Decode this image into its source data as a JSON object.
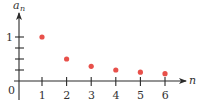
{
  "chart_data": {
    "type": "scatter",
    "title": "",
    "xlabel": "n",
    "ylabel": "a_n",
    "ylabel_main": "a",
    "ylabel_sub": "n",
    "x": [
      1,
      2,
      3,
      4,
      5,
      6
    ],
    "series": [
      {
        "name": "a_n = 1/n",
        "values": [
          1,
          0.5,
          0.333,
          0.25,
          0.2,
          0.167
        ],
        "color": "#E8504A"
      }
    ],
    "x_ticks": [
      "1",
      "2",
      "3",
      "4",
      "5",
      "6"
    ],
    "y_ticks": [
      0.25,
      0.5,
      0.75,
      1
    ],
    "y_tick_labels": {
      "1": "1"
    },
    "origin_label": "0",
    "xlim": [
      0,
      6.8
    ],
    "ylim": [
      0,
      1.6
    ],
    "grid": false,
    "legend": "none"
  },
  "style": {
    "point_color": "#E8504A",
    "axis_color": "#2a2a2a"
  }
}
